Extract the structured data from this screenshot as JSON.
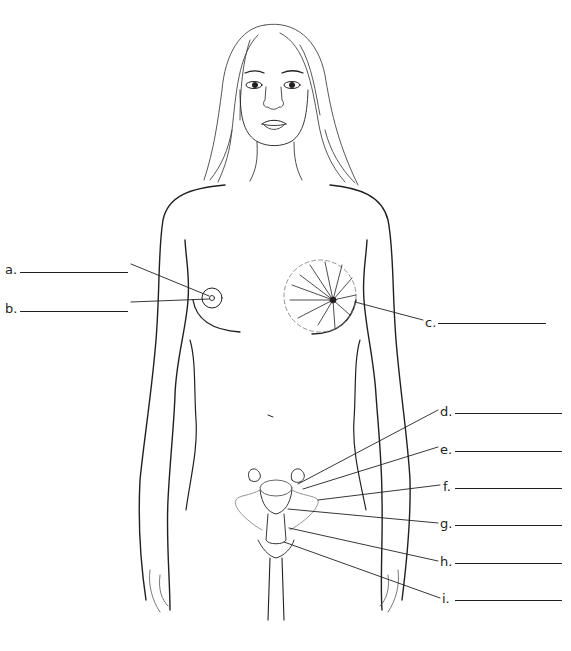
{
  "diagram": {
    "title": "",
    "labels": [
      {
        "id": "a",
        "text": "a.",
        "x": 5,
        "y": 263,
        "blank_x": 20,
        "blank_w": 108,
        "side": "left",
        "points_to": "areola",
        "target": [
          212,
          297
        ]
      },
      {
        "id": "b",
        "text": "b.",
        "x": 5,
        "y": 302,
        "blank_x": 20,
        "blank_w": 108,
        "side": "left",
        "points_to": "nipple",
        "target": [
          211,
          299
        ]
      },
      {
        "id": "c",
        "text": "c.",
        "x": 425,
        "y": 316,
        "blank_x": 438,
        "blank_w": 108,
        "side": "right",
        "points_to": "mammary gland",
        "target": [
          355,
          302
        ]
      },
      {
        "id": "d",
        "text": "d.",
        "x": 440,
        "y": 405,
        "blank_x": 455,
        "blank_w": 107,
        "side": "right",
        "points_to": "ovary",
        "target": [
          298,
          484
        ]
      },
      {
        "id": "e",
        "text": "e.",
        "x": 440,
        "y": 443,
        "blank_x": 455,
        "blank_w": 107,
        "side": "right",
        "points_to": "ovary follicle",
        "target": [
          303,
          489
        ]
      },
      {
        "id": "f",
        "text": "f.",
        "x": 443,
        "y": 480,
        "blank_x": 455,
        "blank_w": 107,
        "side": "right",
        "points_to": "fallopian tube",
        "target": [
          318,
          500
        ]
      },
      {
        "id": "g",
        "text": "g.",
        "x": 440,
        "y": 517,
        "blank_x": 455,
        "blank_w": 107,
        "side": "right",
        "points_to": "uterus",
        "target": [
          288,
          509
        ]
      },
      {
        "id": "h",
        "text": "h.",
        "x": 440,
        "y": 555,
        "blank_x": 455,
        "blank_w": 107,
        "side": "right",
        "points_to": "cervix",
        "target": [
          289,
          528
        ]
      },
      {
        "id": "i",
        "text": "i.",
        "x": 442,
        "y": 592,
        "blank_x": 455,
        "blank_w": 107,
        "side": "right",
        "points_to": "vagina",
        "target": [
          284,
          542
        ]
      }
    ]
  },
  "colors": {
    "ink": "#231f20",
    "light_ink": "#8a8a8a",
    "background": "#ffffff"
  }
}
